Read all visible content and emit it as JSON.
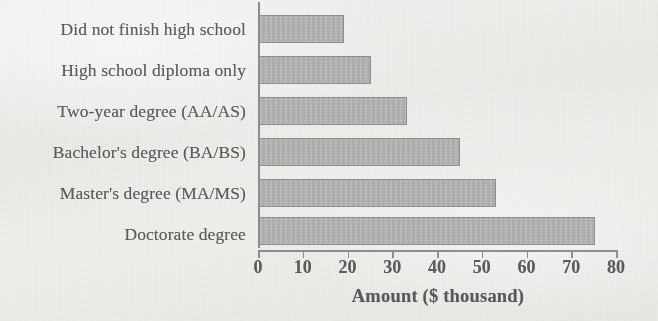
{
  "chart_data": {
    "type": "bar",
    "orientation": "horizontal",
    "title": "",
    "xlabel": "Amount ($ thousand)",
    "ylabel": "",
    "categories": [
      "Did not finish high school",
      "High school diploma only",
      "Two-year degree (AA/AS)",
      "Bachelor's degree (BA/BS)",
      "Master's degree (MA/MS)",
      "Doctorate degree"
    ],
    "values": [
      19,
      25,
      33,
      45,
      53,
      75
    ],
    "xlim": [
      0,
      80
    ],
    "xticks": [
      0,
      10,
      20,
      30,
      40,
      50,
      60,
      70,
      80
    ],
    "xtick_labels": [
      "0",
      "10",
      "20",
      "30",
      "40",
      "50",
      "60",
      "70",
      "80"
    ],
    "grid": false,
    "legend": false,
    "bar_fill_color": "#b2b2b0",
    "bar_edge_color": "#8f8f8d",
    "axis_color": "#8e8e8e",
    "text_color": "#5c5c5c",
    "background_color": "#eeeeec"
  }
}
